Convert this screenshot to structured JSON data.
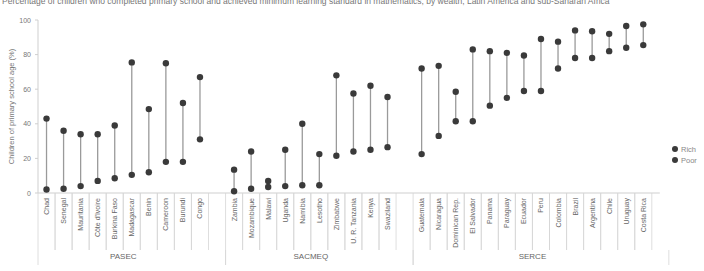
{
  "title": "Percentage of children who completed primary school and achieved minimum learning standard in mathematics, by wealth, Latin America and sub-Saharan Africa",
  "chart_data": {
    "type": "dumbbell",
    "title": "Percentage of children who completed primary school and achieved minimum learning standard in mathematics, by wealth, Latin America and sub-Saharan Africa",
    "xlabel": "",
    "ylabel": "Children of primary school age (%)",
    "ylim": [
      0,
      100
    ],
    "yticks": [
      0,
      20,
      40,
      60,
      80,
      100
    ],
    "grid": false,
    "legend_position": "right",
    "legend": [
      {
        "name": "Rich",
        "color": "#3a3a3a"
      },
      {
        "name": "Poor",
        "color": "#3a3a3a"
      }
    ],
    "groups": [
      {
        "name": "PASEC",
        "categories": [
          "Chad",
          "Senegal",
          "Mauritania",
          "Côte d'Ivoire",
          "Burkina Faso",
          "Madagascar",
          "Benin",
          "Cameroon",
          "Burundi",
          "Congo"
        ]
      },
      {
        "name": "SACMEQ",
        "categories": [
          "Zambia",
          "Mozambique",
          "Malawi",
          "Uganda",
          "Namibia",
          "Lesotho",
          "Zimbabwe",
          "U. R. Tanzania",
          "Kenya",
          "Swaziland"
        ]
      },
      {
        "name": "SERCE",
        "categories": [
          "Guatemala",
          "Nicaragua",
          "Dominican Rep.",
          "El Salvador",
          "Panama",
          "Paraguay",
          "Ecuador",
          "Peru",
          "Colombia",
          "Brazil",
          "Argentina",
          "Chile",
          "Uruguay",
          "Costa Rica"
        ]
      }
    ],
    "categories": [
      "Chad",
      "Senegal",
      "Mauritania",
      "Côte d'Ivoire",
      "Burkina Faso",
      "Madagascar",
      "Benin",
      "Cameroon",
      "Burundi",
      "Congo",
      "Zambia",
      "Mozambique",
      "Malawi",
      "Uganda",
      "Namibia",
      "Lesotho",
      "Zimbabwe",
      "U. R. Tanzania",
      "Kenya",
      "Swaziland",
      "Guatemala",
      "Nicaragua",
      "Dominican Rep.",
      "El Salvador",
      "Panama",
      "Paraguay",
      "Ecuador",
      "Peru",
      "Colombia",
      "Brazil",
      "Argentina",
      "Chile",
      "Uruguay",
      "Costa Rica"
    ],
    "series": [
      {
        "name": "Rich",
        "values": [
          43,
          36,
          34,
          34,
          39,
          75.5,
          48.5,
          75,
          52,
          67,
          13.5,
          24,
          7,
          25,
          40,
          22.5,
          68,
          57.5,
          62,
          55.5,
          72,
          73.5,
          58.5,
          83,
          82,
          81,
          79.5,
          89,
          87.5,
          94,
          93.5,
          92,
          96.5,
          97.5
        ]
      },
      {
        "name": "Poor",
        "values": [
          2,
          2.5,
          4,
          7,
          8.5,
          10.5,
          12,
          18,
          18,
          31,
          1,
          2.5,
          3.5,
          4,
          4.5,
          4.5,
          21.5,
          24,
          25,
          26.5,
          22.5,
          33,
          41.5,
          41.5,
          50.5,
          55,
          59,
          59,
          72,
          78,
          78,
          82,
          84,
          85.5
        ]
      }
    ]
  }
}
